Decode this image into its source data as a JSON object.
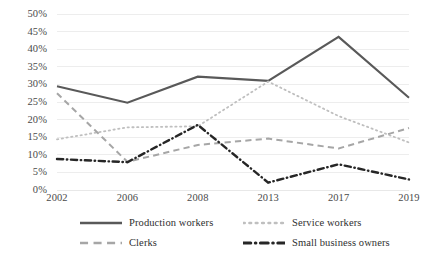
{
  "chart_data": {
    "type": "line",
    "title": "",
    "subtitle": "",
    "xlabel": "",
    "ylabel": "",
    "categories": [
      "2002",
      "2006",
      "2008",
      "2013",
      "2017",
      "2019"
    ],
    "ylim": [
      0,
      50
    ],
    "ytick_step": 5,
    "ytick_labels": [
      "0%",
      "5%",
      "10%",
      "15%",
      "20%",
      "25%",
      "30%",
      "35%",
      "40%",
      "45%",
      "50%"
    ],
    "ytick_values": [
      0,
      5,
      10,
      15,
      20,
      25,
      30,
      35,
      40,
      45,
      50
    ],
    "grid": true,
    "grid_axis": "y",
    "legend_position": "bottom",
    "value_unit": "%",
    "series": [
      {
        "name": "Production workers",
        "style": "solid",
        "color": "#595959",
        "values": [
          29.5,
          24.8,
          32.2,
          31.0,
          43.5,
          26.2
        ]
      },
      {
        "name": "Service workers",
        "style": "dotted",
        "color": "#bfbfbf",
        "values": [
          14.4,
          17.8,
          18.1,
          30.8,
          21.0,
          13.5
        ]
      },
      {
        "name": "Clerks",
        "style": "dashed",
        "color": "#a6a6a6",
        "values": [
          27.5,
          8.0,
          12.8,
          14.6,
          11.8,
          17.6
        ]
      },
      {
        "name": "Small business owners",
        "style": "dash-dot",
        "color": "#262626",
        "values": [
          8.8,
          7.9,
          18.5,
          2.1,
          7.3,
          3.0
        ]
      }
    ]
  },
  "legend": {
    "items": [
      {
        "label": "Production workers"
      },
      {
        "label": "Service workers"
      },
      {
        "label": "Clerks"
      },
      {
        "label": "Small business owners"
      }
    ]
  },
  "colors": {
    "grid": "#e8e8e8",
    "text": "#4a4a4a",
    "background": "#ffffff"
  }
}
